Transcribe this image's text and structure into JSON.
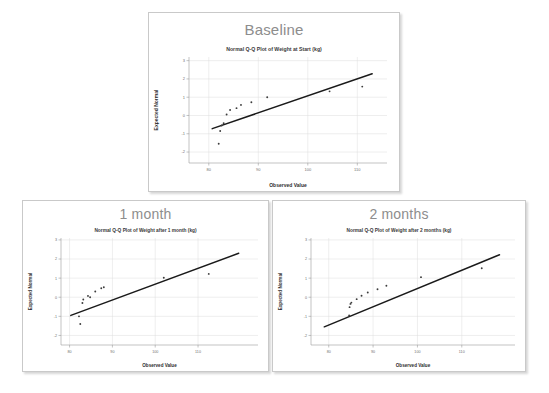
{
  "page": {
    "background_color": "#ffffff",
    "panel_border_color": "#c9c9c9",
    "title_color": "#8d8d8d",
    "point_color": "#3c3c3c",
    "line_color": "#1a1a1a",
    "grid_color": "#dcdcdc"
  },
  "panels": [
    {
      "id": "baseline",
      "title": "Baseline",
      "chart_index": 0
    },
    {
      "id": "month1",
      "title": "1 month",
      "chart_index": 1
    },
    {
      "id": "month2",
      "title": "2 months",
      "chart_index": 2
    }
  ],
  "chart_data": [
    {
      "type": "scatter",
      "title": "Normal Q-Q Plot of Weight at Start (kg)",
      "xlabel": "Observed Value",
      "ylabel": "Expected Normal",
      "xlim": [
        76,
        116
      ],
      "ylim": [
        -2.6,
        3.2
      ],
      "xticks": [
        80,
        90,
        100,
        110
      ],
      "yticks": [
        3,
        2,
        1,
        0,
        -1,
        -2
      ],
      "xticklabels": [
        "80",
        "90",
        "100",
        "110"
      ],
      "yticklabels": [
        "3",
        "2",
        "1",
        "0",
        "-1",
        "-2"
      ],
      "grid": true,
      "legend": "none",
      "points": [
        {
          "x": 82.0,
          "y": -1.55
        },
        {
          "x": 82.3,
          "y": -0.85
        },
        {
          "x": 82.6,
          "y": -0.55
        },
        {
          "x": 83.0,
          "y": -0.42
        },
        {
          "x": 83.6,
          "y": 0.05
        },
        {
          "x": 84.3,
          "y": 0.3
        },
        {
          "x": 85.6,
          "y": 0.4
        },
        {
          "x": 86.5,
          "y": 0.58
        },
        {
          "x": 88.6,
          "y": 0.72
        },
        {
          "x": 91.8,
          "y": 1.0
        },
        {
          "x": 104.4,
          "y": 1.32
        },
        {
          "x": 111.0,
          "y": 1.58
        }
      ],
      "fit_line": {
        "x1": 80.7,
        "y1": -0.72,
        "x2": 113.0,
        "y2": 2.28
      }
    },
    {
      "type": "scatter",
      "title": "Normal Q-Q Plot of Weight after 1 month (kg)",
      "xlabel": "Observed Value",
      "ylabel": "Expected Normal",
      "xlim": [
        78,
        124
      ],
      "ylim": [
        -2.5,
        3.1
      ],
      "xticks": [
        80,
        90,
        100,
        110
      ],
      "yticks": [
        3,
        2,
        1,
        0,
        -1,
        -2
      ],
      "xticklabels": [
        "80",
        "90",
        "100",
        "110"
      ],
      "yticklabels": [
        "3",
        "2",
        "1",
        "0",
        "-1",
        "-2"
      ],
      "grid": true,
      "legend": "none",
      "points": [
        {
          "x": 82.5,
          "y": -1.4
        },
        {
          "x": 82.2,
          "y": -1.0
        },
        {
          "x": 83.0,
          "y": -0.3
        },
        {
          "x": 83.2,
          "y": -0.12
        },
        {
          "x": 84.3,
          "y": 0.07
        },
        {
          "x": 84.8,
          "y": 0.0
        },
        {
          "x": 86.0,
          "y": 0.3
        },
        {
          "x": 87.4,
          "y": 0.47
        },
        {
          "x": 88.0,
          "y": 0.52
        },
        {
          "x": 102.0,
          "y": 1.02
        },
        {
          "x": 112.5,
          "y": 1.22
        }
      ],
      "fit_line": {
        "x1": 80.3,
        "y1": -0.95,
        "x2": 119.5,
        "y2": 2.3
      }
    },
    {
      "type": "scatter",
      "title": "Normal Q-Q Plot of Weight after 2 months (kg)",
      "xlabel": "Observed Value",
      "ylabel": "Expected Normal",
      "xlim": [
        76,
        122
      ],
      "ylim": [
        -2.5,
        3.1
      ],
      "xticks": [
        80,
        90,
        100,
        110
      ],
      "yticks": [
        3,
        2,
        1,
        0,
        -1,
        -2
      ],
      "xticklabels": [
        "80",
        "90",
        "100",
        "110"
      ],
      "yticklabels": [
        "3",
        "2",
        "1",
        "0",
        "-1",
        "-2"
      ],
      "grid": true,
      "legend": "none",
      "points": [
        {
          "x": 84.6,
          "y": -0.95
        },
        {
          "x": 84.7,
          "y": -0.52
        },
        {
          "x": 84.9,
          "y": -0.35
        },
        {
          "x": 85.1,
          "y": -0.28
        },
        {
          "x": 86.3,
          "y": -0.1
        },
        {
          "x": 87.4,
          "y": 0.08
        },
        {
          "x": 88.8,
          "y": 0.25
        },
        {
          "x": 91.0,
          "y": 0.42
        },
        {
          "x": 93.0,
          "y": 0.6
        },
        {
          "x": 100.8,
          "y": 1.05
        },
        {
          "x": 114.5,
          "y": 1.52
        }
      ],
      "fit_line": {
        "x1": 79.0,
        "y1": -1.55,
        "x2": 118.5,
        "y2": 2.22
      }
    }
  ]
}
